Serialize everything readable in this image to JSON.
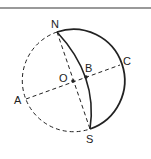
{
  "diagram": {
    "type": "sphere-geometry",
    "colors": {
      "stroke": "#222222",
      "top_rule": "#777777",
      "background": "#ffffff"
    },
    "labels": {
      "N": "N",
      "S": "S",
      "O": "O",
      "A": "A",
      "B": "B",
      "C": "C"
    },
    "elements": [
      "dashed circle (sphere outline) centered at O",
      "dashed diameter NS",
      "dashed diameter AC through O and B",
      "solid arc NCS (right hemisphere outline)",
      "solid arc NBS (great circle meridian)",
      "points O and B marked as dots"
    ]
  }
}
